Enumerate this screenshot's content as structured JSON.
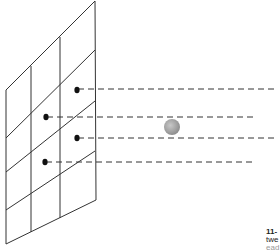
{
  "diagram": {
    "type": "projection-grid",
    "panel": {
      "shape": "parallelogram",
      "stroke": "#333333",
      "corners": [
        [
          6,
          90
        ],
        [
          95,
          1
        ],
        [
          96,
          200
        ],
        [
          6,
          244
        ]
      ],
      "columns": 3,
      "rows": 4
    },
    "dots": [
      {
        "x": 77,
        "y": 90
      },
      {
        "x": 46,
        "y": 117
      },
      {
        "x": 77,
        "y": 138
      },
      {
        "x": 45,
        "y": 162
      }
    ],
    "rays": [
      {
        "y": 89,
        "x_end": 278
      },
      {
        "y": 117,
        "x_end": 253
      },
      {
        "y": 138,
        "x_end": 278
      },
      {
        "y": 162,
        "x_end": 253
      }
    ],
    "sphere": {
      "x": 172,
      "y": 127,
      "r": 8,
      "color": "#aaaaaa"
    }
  },
  "caption": {
    "line1": "11-",
    "line2": "twe",
    "line3": "ead"
  }
}
